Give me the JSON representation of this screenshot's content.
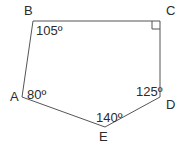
{
  "figure": {
    "type": "geometry-polygon-diagram",
    "shape_name": "pentagon ABCDE",
    "stroke_color": "#555555",
    "text_color": "#2b2b2b",
    "background_color": "#ffffff",
    "vertices": [
      {
        "name": "A",
        "x": 22,
        "y": 97,
        "label": "A",
        "label_x": 10,
        "label_y": 90
      },
      {
        "name": "B",
        "x": 33,
        "y": 21,
        "label": "B",
        "label_x": 24,
        "label_y": 4
      },
      {
        "name": "C",
        "x": 160,
        "y": 21,
        "label": "C",
        "label_x": 166,
        "label_y": 4
      },
      {
        "name": "D",
        "x": 160,
        "y": 97,
        "label": "D",
        "label_x": 166,
        "label_y": 98
      },
      {
        "name": "E",
        "x": 105,
        "y": 127,
        "label": "E",
        "label_x": 99,
        "label_y": 130
      }
    ],
    "edges": [
      {
        "from": "A",
        "to": "B"
      },
      {
        "from": "B",
        "to": "C"
      },
      {
        "from": "C",
        "to": "D"
      },
      {
        "from": "D",
        "to": "E"
      },
      {
        "from": "E",
        "to": "A"
      }
    ],
    "angles": [
      {
        "at": "A",
        "value": 80,
        "label": "80º",
        "label_x": 27,
        "label_y": 88
      },
      {
        "at": "B",
        "value": 105,
        "label": "105º",
        "label_x": 36,
        "label_y": 24
      },
      {
        "at": "C",
        "value": 90,
        "label": "",
        "marker": "right-angle-square"
      },
      {
        "at": "D",
        "value": 125,
        "label": "125º",
        "label_x": 136,
        "label_y": 85
      },
      {
        "at": "E",
        "value": 140,
        "label": "140º",
        "label_x": 96,
        "label_y": 111
      }
    ],
    "right_angle_marker": {
      "at": "C",
      "size": 8,
      "x": 152,
      "y": 21
    }
  }
}
